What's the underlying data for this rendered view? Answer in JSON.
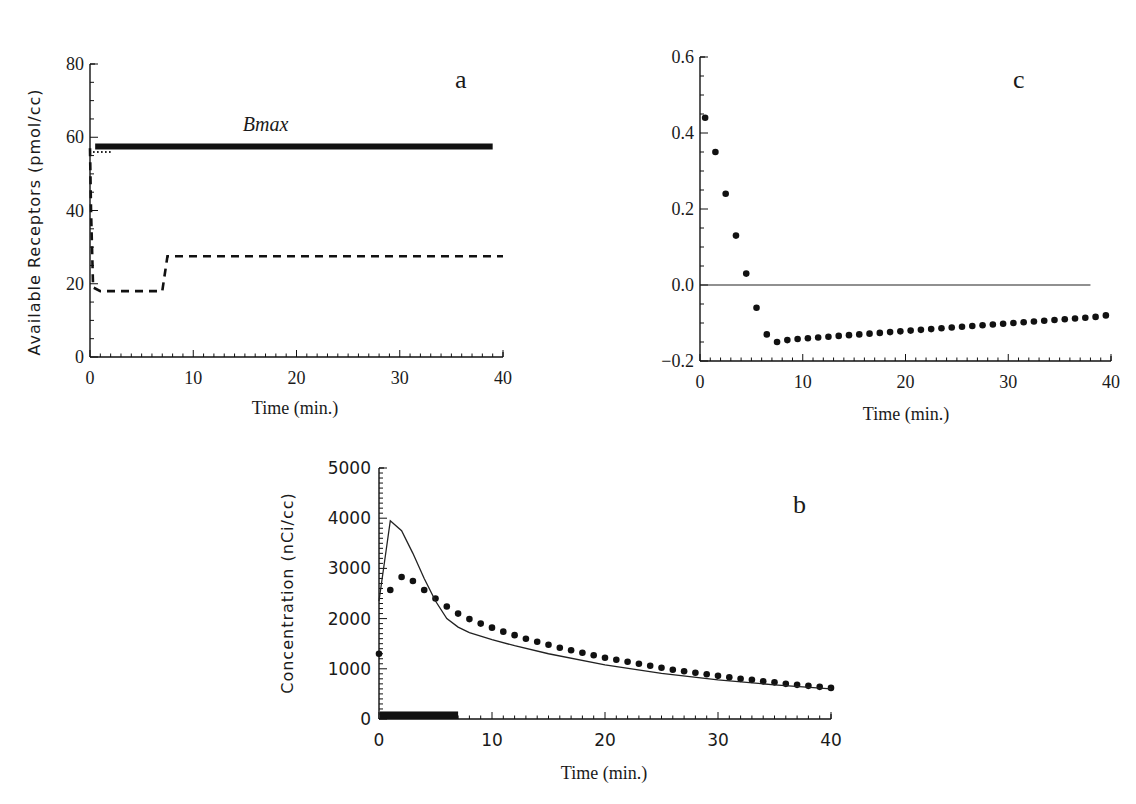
{
  "figure": {
    "panels": [
      "a",
      "b",
      "c"
    ]
  },
  "chart_data": [
    {
      "id": "a",
      "type": "line",
      "panel_label": "a",
      "title": "",
      "xlabel": "Time (min.)",
      "ylabel": "Available Receptors (pmol/cc)",
      "xlim": [
        0,
        40
      ],
      "ylim": [
        0,
        80
      ],
      "xticks": [
        0,
        10,
        20,
        30,
        40
      ],
      "yticks": [
        0,
        20,
        40,
        60,
        80
      ],
      "grid": false,
      "annotations": [
        {
          "text": "Bmax",
          "x": 17,
          "y": 63,
          "style": "italic"
        }
      ],
      "series": [
        {
          "name": "Bmax",
          "style": "solid-thick",
          "x": [
            0.5,
            39
          ],
          "y": [
            57.5,
            57.5
          ]
        },
        {
          "name": "Available receptors (dashed)",
          "style": "dashed",
          "x": [
            0,
            0.1,
            0.3,
            1,
            7,
            7.5,
            40
          ],
          "y": [
            57,
            40,
            19,
            18,
            18,
            27.5,
            27.5
          ]
        },
        {
          "name": "Available receptors (dotted)",
          "style": "dotted",
          "x": [
            0.3,
            2.2
          ],
          "y": [
            56,
            56
          ]
        }
      ]
    },
    {
      "id": "c",
      "type": "scatter",
      "panel_label": "c",
      "title": "",
      "xlabel": "Time (min.)",
      "ylabel": "",
      "xlim": [
        0,
        40
      ],
      "ylim": [
        -0.2,
        0.6
      ],
      "xticks": [
        0,
        10,
        20,
        30,
        40
      ],
      "yticks": [
        -0.2,
        0.0,
        0.2,
        0.4,
        0.6
      ],
      "ytick_labels": [
        "−0.2",
        "0.0",
        "0.2",
        "0.4",
        "0.6"
      ],
      "grid": false,
      "reference_line": {
        "y": 0.0,
        "x": [
          0,
          38
        ]
      },
      "series": [
        {
          "name": "Residuals",
          "x": [
            0.5,
            1.5,
            2.5,
            3.5,
            4.5,
            5.5,
            6.5,
            7.5,
            8.5,
            9.5,
            10.5,
            11.5,
            12.5,
            13.5,
            14.5,
            15.5,
            16.5,
            17.5,
            18.5,
            19.5,
            20.5,
            21.5,
            22.5,
            23.5,
            24.5,
            25.5,
            26.5,
            27.5,
            28.5,
            29.5,
            30.5,
            31.5,
            32.5,
            33.5,
            34.5,
            35.5,
            36.5,
            37.5,
            38.5,
            39.5
          ],
          "y": [
            0.44,
            0.35,
            0.24,
            0.13,
            0.03,
            -0.06,
            -0.13,
            -0.15,
            -0.145,
            -0.142,
            -0.14,
            -0.138,
            -0.136,
            -0.134,
            -0.132,
            -0.13,
            -0.128,
            -0.126,
            -0.124,
            -0.122,
            -0.12,
            -0.118,
            -0.116,
            -0.114,
            -0.112,
            -0.11,
            -0.108,
            -0.106,
            -0.104,
            -0.102,
            -0.1,
            -0.098,
            -0.096,
            -0.094,
            -0.092,
            -0.09,
            -0.088,
            -0.086,
            -0.084,
            -0.08
          ]
        }
      ]
    },
    {
      "id": "b",
      "type": "line",
      "panel_label": "b",
      "title": "",
      "xlabel": "Time (min.)",
      "ylabel": "Concentration (nCi/cc)",
      "xlim": [
        0,
        40
      ],
      "ylim": [
        0,
        5000
      ],
      "xticks": [
        0,
        10,
        20,
        30,
        40
      ],
      "yticks": [
        0,
        1000,
        2000,
        3000,
        4000,
        5000
      ],
      "grid": false,
      "infusion_bar": {
        "x": [
          0,
          7
        ],
        "height": 150
      },
      "series": [
        {
          "name": "Measured (dots)",
          "style": "dots",
          "x": [
            0,
            1,
            2,
            3,
            4,
            5,
            6,
            7,
            8,
            9,
            10,
            11,
            12,
            13,
            14,
            15,
            16,
            17,
            18,
            19,
            20,
            21,
            22,
            23,
            24,
            25,
            26,
            27,
            28,
            29,
            30,
            31,
            32,
            33,
            34,
            35,
            36,
            37,
            38,
            39,
            40
          ],
          "y": [
            1300,
            2570,
            2830,
            2750,
            2570,
            2400,
            2240,
            2100,
            1990,
            1900,
            1820,
            1740,
            1670,
            1600,
            1540,
            1480,
            1420,
            1370,
            1320,
            1270,
            1220,
            1180,
            1140,
            1100,
            1060,
            1020,
            980,
            950,
            920,
            890,
            860,
            830,
            800,
            780,
            750,
            730,
            700,
            680,
            660,
            640,
            620
          ]
        },
        {
          "name": "Model (solid)",
          "style": "solid",
          "x": [
            0,
            1,
            2,
            3,
            4,
            5,
            6,
            7,
            8,
            10,
            12,
            15,
            20,
            25,
            30,
            35,
            40
          ],
          "y": [
            2350,
            3950,
            3750,
            3300,
            2800,
            2350,
            2000,
            1830,
            1720,
            1580,
            1460,
            1300,
            1080,
            910,
            780,
            680,
            600
          ]
        }
      ]
    }
  ]
}
